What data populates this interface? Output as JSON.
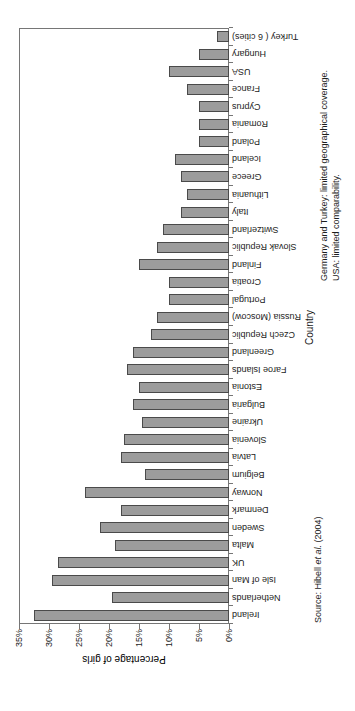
{
  "chart_data": {
    "type": "bar",
    "title": "",
    "xlabel": "Country",
    "ylabel": "Percentage of girls",
    "ylim": [
      0,
      35
    ],
    "ytick_step": 5,
    "ytick_labels": [
      "0%",
      "5%",
      "10%",
      "15%",
      "20%",
      "25%",
      "30%",
      "35%"
    ],
    "grid": false,
    "legend": null,
    "bar_fill": "#9c9c9c",
    "bar_stroke": "#4a4a4a",
    "axis_color": "#767676",
    "orientation": "vertical bars, whole figure rotated 90deg counter-clockwise on the page",
    "categories": [
      "Ireland",
      "Netherlands",
      "Isle of Man",
      "UK",
      "Malta",
      "Sweden",
      "Denmark",
      "Norway",
      "Belgium",
      "Latvia",
      "Slovenia",
      "Ukraine",
      "Bulgaria",
      "Estonia",
      "Faroe Islands",
      "Greenland",
      "Czech Republic",
      "Russia (Moscow)",
      "Portugal",
      "Croatia",
      "Finland",
      "Slovak Republic",
      "Switzerland",
      "Italy",
      "Lithuania",
      "Greece",
      "Iceland",
      "Poland",
      "Romania",
      "Cyprus",
      "France",
      "USA",
      "Hungary",
      "Turkey ( 6 cities)"
    ],
    "values": [
      32.5,
      19.5,
      29.5,
      28.5,
      19,
      21.5,
      18,
      24,
      14,
      18,
      17.5,
      14.5,
      16,
      15,
      17,
      16,
      13,
      12,
      10,
      10,
      15,
      12,
      11,
      8,
      7,
      8,
      9,
      5,
      5,
      5,
      7,
      10,
      5,
      2
    ],
    "footnotes": [
      "Germany and Turkey: limited geographical coverage.",
      "USA: limited comparability."
    ]
  },
  "annotations": {
    "source_prefix": "Source: Hibell ",
    "source_etal": "et al.",
    "source_suffix": " (2004)"
  }
}
